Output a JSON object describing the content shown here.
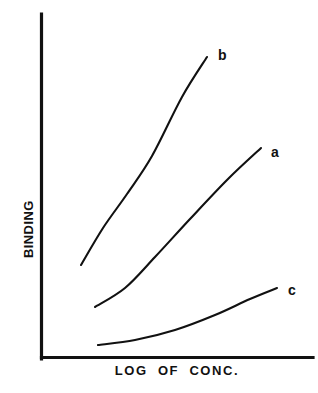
{
  "chart_data": {
    "type": "line",
    "title": "",
    "subtitle": "",
    "xlabel": "LOG OF CONC.",
    "ylabel": "BINDING",
    "xlim": [
      0,
      100
    ],
    "ylim": [
      0,
      100
    ],
    "grid": false,
    "x_tick_labels": [],
    "y_tick_labels": [],
    "legend_position": "inline-curve-end",
    "line_color": "#111111",
    "axis_color": "#111111",
    "background_color": "#ffffff",
    "annotations": [
      "Three sigmoid-like binding curves rising with log of concentration",
      "Curve b is highest and steepest, curve a intermediate, curve c lowest and flattest"
    ],
    "series": [
      {
        "name": "b",
        "label": "b",
        "description": "highest, steepest rising curve",
        "x": [
          15,
          25,
          35,
          45,
          55,
          62
        ],
        "y": [
          27,
          40,
          52,
          65,
          79,
          87
        ],
        "points_px": [
          [
            81,
            265
          ],
          [
            103,
            228
          ],
          [
            127,
            194
          ],
          [
            152,
            156
          ],
          [
            182,
            97
          ],
          [
            207,
            57
          ]
        ],
        "label_px": [
          218,
          48
        ]
      },
      {
        "name": "a",
        "label": "a",
        "description": "intermediate curve",
        "x": [
          20,
          32,
          44,
          56,
          68,
          81
        ],
        "y": [
          15,
          23,
          33,
          45,
          57,
          61
        ],
        "points_px": [
          [
            95,
            307
          ],
          [
            125,
            288
          ],
          [
            155,
            257
          ],
          [
            190,
            219
          ],
          [
            228,
            179
          ],
          [
            261,
            148
          ]
        ],
        "label_px": [
          271,
          145
        ]
      },
      {
        "name": "c",
        "label": "c",
        "description": "lowest, flattest curve",
        "x": [
          21,
          35,
          50,
          65,
          78,
          88
        ],
        "y": [
          4,
          6,
          9,
          13,
          18,
          20
        ],
        "points_px": [
          [
            98,
            345
          ],
          [
            135,
            340
          ],
          [
            175,
            330
          ],
          [
            215,
            315
          ],
          [
            250,
            299
          ],
          [
            277,
            288
          ]
        ],
        "label_px": [
          288,
          283
        ]
      }
    ]
  },
  "axes": {
    "y_axis_title": "BINDING",
    "x_axis_title": "LOG OF CONC."
  },
  "labels": {
    "curve_b": "b",
    "curve_a": "a",
    "curve_c": "c"
  }
}
